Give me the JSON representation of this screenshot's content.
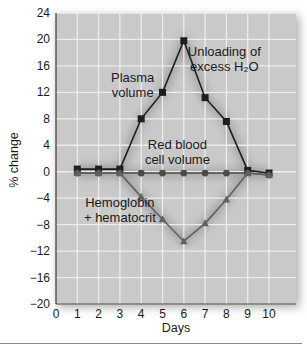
{
  "chart_data": {
    "type": "line",
    "title": "",
    "xlabel": "Days",
    "ylabel": "% change",
    "xlim": [
      0,
      11
    ],
    "ylim": [
      -20,
      24
    ],
    "x_ticks": [
      0,
      1,
      2,
      3,
      4,
      5,
      6,
      7,
      8,
      9,
      10
    ],
    "y_ticks": [
      24,
      20,
      16,
      12,
      8,
      4,
      0,
      -4,
      -8,
      -12,
      -16,
      -20
    ],
    "grid": true,
    "x": [
      1,
      2,
      3,
      4,
      5,
      6,
      7,
      8,
      9,
      10
    ],
    "series": [
      {
        "name": "Plasma volume",
        "marker": "square",
        "color": "#1e1e1e",
        "values": [
          0.4,
          0.4,
          0.4,
          8,
          12,
          19.8,
          11.2,
          7.6,
          0.2,
          -0.2
        ]
      },
      {
        "name": "Red blood cell volume",
        "marker": "circle",
        "color": "#4a4a4a",
        "values": [
          -0.2,
          -0.2,
          -0.2,
          -0.2,
          -0.2,
          -0.2,
          -0.2,
          -0.2,
          -0.2,
          -0.5
        ]
      },
      {
        "name": "Hemoglobin + hematocrit",
        "marker": "triangle",
        "color": "#606060",
        "values": [
          -0.2,
          -0.2,
          -0.2,
          -3.8,
          -7.2,
          -10.5,
          -7.8,
          -4.2,
          -0.2,
          -0.5
        ]
      }
    ],
    "annotations": [
      {
        "lines": [
          "Plasma",
          "volume"
        ],
        "x": 3.6,
        "y": 13.5
      },
      {
        "lines": [
          "Unloading of",
          "excess H₂O"
        ],
        "x": 7.9,
        "y": 17.5
      },
      {
        "lines": [
          "Red blood",
          "cell volume"
        ],
        "x": 5.7,
        "y": 3.4
      },
      {
        "lines": [
          "Hemoglobin",
          "+ hematocrit"
        ],
        "x": 3.0,
        "y": -5.4
      }
    ],
    "colors": {
      "plot_background": "#c9c9c9",
      "grid": "#ececec",
      "axis": "#3a3a3a"
    }
  }
}
